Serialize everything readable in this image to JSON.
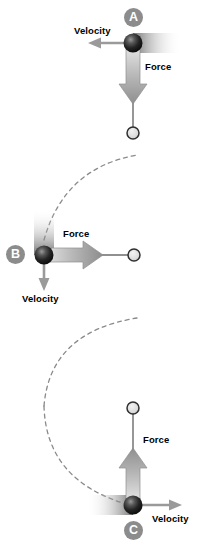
{
  "figure": {
    "type": "physics-vector-diagram",
    "background_color": "#ffffff",
    "width": 202,
    "height": 549
  },
  "panels": [
    {
      "id": "A",
      "badge_label": "A",
      "badge": {
        "x": 124,
        "y": 8,
        "color": "#8c8c8c",
        "text_color": "#ffffff"
      },
      "bob": {
        "x": 133,
        "y": 43,
        "radius": 9,
        "color": "#141414"
      },
      "pivot": {
        "x": 133,
        "y": 133,
        "radius": 6,
        "color": "#d8d8d8",
        "stroke": "#3a3a3a"
      },
      "rod": {
        "x1": 133,
        "y1": 43,
        "x2": 133,
        "y2": 133,
        "color": "#6b6b6b"
      },
      "motion_blur": {
        "x": 133,
        "y": 43,
        "direction": "horizontal-right",
        "length": 46
      },
      "vectors": [
        {
          "name": "Velocity",
          "label": "Velocity",
          "direction": "left",
          "x1": 133,
          "y1": 43,
          "x2": 92,
          "y2": 43,
          "color": "#9a9a9a",
          "label_x": 75,
          "label_y": 27
        },
        {
          "name": "Force",
          "label": "Force",
          "direction": "down",
          "x1": 133,
          "y1": 48,
          "x2": 133,
          "y2": 100,
          "color": "#9a9a9a",
          "label_x": 145,
          "label_y": 64
        }
      ]
    },
    {
      "id": "B",
      "badge_label": "B",
      "badge": {
        "x": 6,
        "y": 245,
        "color": "#8c8c8c",
        "text_color": "#ffffff"
      },
      "bob": {
        "x": 44,
        "y": 255,
        "radius": 9,
        "color": "#141414"
      },
      "pivot": {
        "x": 134,
        "y": 255,
        "radius": 6,
        "color": "#d8d8d8",
        "stroke": "#3a3a3a"
      },
      "rod": {
        "x1": 44,
        "y1": 255,
        "x2": 134,
        "y2": 255,
        "color": "#6b6b6b"
      },
      "motion_blur": {
        "x": 44,
        "y": 255,
        "direction": "vertical-up",
        "length": 42
      },
      "vectors": [
        {
          "name": "Force",
          "label": "Force",
          "direction": "right",
          "x1": 49,
          "y1": 255,
          "x2": 100,
          "y2": 255,
          "color": "#9a9a9a",
          "label_x": 62,
          "label_y": 233
        },
        {
          "name": "Velocity",
          "label": "Velocity",
          "direction": "down",
          "x1": 44,
          "y1": 260,
          "x2": 44,
          "y2": 289,
          "color": "#9a9a9a",
          "label_x": 22,
          "label_y": 293
        }
      ]
    },
    {
      "id": "C",
      "badge_label": "C",
      "badge": {
        "x": 124,
        "y": 521,
        "color": "#8c8c8c",
        "text_color": "#ffffff"
      },
      "bob": {
        "x": 133,
        "y": 505,
        "radius": 9,
        "color": "#141414"
      },
      "pivot": {
        "x": 133,
        "y": 408,
        "radius": 6,
        "color": "#d8d8d8",
        "stroke": "#3a3a3a"
      },
      "rod": {
        "x1": 133,
        "y1": 408,
        "x2": 133,
        "y2": 505,
        "color": "#6b6b6b"
      },
      "motion_blur": {
        "x": 133,
        "y": 505,
        "direction": "horizontal-left",
        "length": 44
      },
      "vectors": [
        {
          "name": "Force",
          "label": "Force",
          "direction": "up",
          "x1": 133,
          "y1": 500,
          "x2": 133,
          "y2": 452,
          "color": "#9a9a9a",
          "label_x": 143,
          "label_y": 437
        },
        {
          "name": "Velocity",
          "label": "Velocity",
          "direction": "right",
          "x1": 138,
          "y1": 505,
          "x2": 180,
          "y2": 505,
          "color": "#9a9a9a",
          "label_x": 154,
          "label_y": 516
        }
      ]
    }
  ],
  "trajectory_arcs": [
    {
      "name": "arc-a-to-b",
      "path": "M 44 240 Q 62 170 135 156",
      "color": "#8a8a8a",
      "dash": "4 4"
    },
    {
      "name": "arc-b-to-c",
      "path": "M 44 404 Q 50 330 135 318",
      "color": "#8a8a8a",
      "dash": "4 4"
    },
    {
      "name": "arc-c-lower",
      "path": "M 36 420 Q 40 480 124 505",
      "color": "#8a8a8a",
      "dash": "4 4"
    }
  ],
  "colors": {
    "bob_dark": "#141414",
    "pivot_fill": "#d8d8d8",
    "pivot_stroke": "#3a3a3a",
    "rod": "#6b6b6b",
    "arrow": "#9a9a9a",
    "badge": "#8c8c8c",
    "arc": "#8a8a8a",
    "text": "#000000",
    "background": "#ffffff"
  }
}
